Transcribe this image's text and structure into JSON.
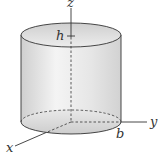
{
  "diagram": {
    "type": "cylinder-in-3d-axes",
    "labels": {
      "z_axis": "z",
      "y_axis": "y",
      "x_axis": "x",
      "height": "h",
      "radius": "b"
    },
    "colors": {
      "outline": "#333333",
      "fill_light": "#f2f2f2",
      "fill_shade": "#d0d0d0"
    }
  }
}
